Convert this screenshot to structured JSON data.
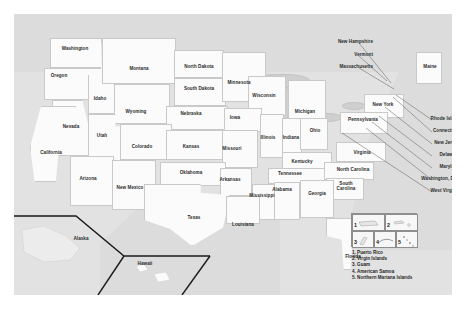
{
  "figure": {
    "kind": "united-states-map",
    "background_color": "#ffffff",
    "panel_color": "#e2e2e2",
    "state_fill": "#fbfbfb",
    "state_border": "#c9c9c9",
    "water_color": "#cfcfcf",
    "label_color": "#2b2b2b"
  },
  "states": [
    {
      "name": "Washington",
      "x": 61,
      "y": 35
    },
    {
      "name": "Oregon",
      "x": 45,
      "y": 62
    },
    {
      "name": "Idaho",
      "x": 86,
      "y": 85
    },
    {
      "name": "Montana",
      "x": 125,
      "y": 55
    },
    {
      "name": "North Dakota",
      "x": 185,
      "y": 53
    },
    {
      "name": "Minnesota",
      "x": 225,
      "y": 69
    },
    {
      "name": "Wyoming",
      "x": 122,
      "y": 98
    },
    {
      "name": "South Dakota",
      "x": 185,
      "y": 75
    },
    {
      "name": "Wisconsin",
      "x": 250,
      "y": 82
    },
    {
      "name": "Michigan",
      "x": 291,
      "y": 98
    },
    {
      "name": "Nevada",
      "x": 57,
      "y": 113
    },
    {
      "name": "Utah",
      "x": 88,
      "y": 122
    },
    {
      "name": "Nebraska",
      "x": 177,
      "y": 100
    },
    {
      "name": "Iowa",
      "x": 221,
      "y": 104
    },
    {
      "name": "Illinois",
      "x": 254,
      "y": 124
    },
    {
      "name": "Indiana",
      "x": 277,
      "y": 124
    },
    {
      "name": "Ohio",
      "x": 301,
      "y": 117
    },
    {
      "name": "New York",
      "x": 369,
      "y": 91
    },
    {
      "name": "Pennsylvania",
      "x": 349,
      "y": 106
    },
    {
      "name": "Maine",
      "x": 416,
      "y": 53
    },
    {
      "name": "California",
      "x": 37,
      "y": 139
    },
    {
      "name": "Colorado",
      "x": 128,
      "y": 133
    },
    {
      "name": "Kansas",
      "x": 177,
      "y": 133
    },
    {
      "name": "Missouri",
      "x": 218,
      "y": 135
    },
    {
      "name": "Kentucky",
      "x": 288,
      "y": 148
    },
    {
      "name": "Virginia",
      "x": 348,
      "y": 139
    },
    {
      "name": "Arizona",
      "x": 74,
      "y": 165
    },
    {
      "name": "New Mexico",
      "x": 116,
      "y": 174
    },
    {
      "name": "Oklahoma",
      "x": 177,
      "y": 159
    },
    {
      "name": "Arkansas",
      "x": 216,
      "y": 166
    },
    {
      "name": "Tennessee",
      "x": 276,
      "y": 160
    },
    {
      "name": "North Carolina",
      "x": 339,
      "y": 156
    },
    {
      "name": "South Carolina",
      "x": 332,
      "y": 172,
      "wrap": true
    },
    {
      "name": "Mississippi",
      "x": 248,
      "y": 182
    },
    {
      "name": "Alabama",
      "x": 268,
      "y": 176
    },
    {
      "name": "Georgia",
      "x": 303,
      "y": 180
    },
    {
      "name": "Texas",
      "x": 180,
      "y": 204
    },
    {
      "name": "Louisiana",
      "x": 229,
      "y": 211
    },
    {
      "name": "Florida",
      "x": 339,
      "y": 243
    },
    {
      "name": "Alaska",
      "x": 67,
      "y": 225
    },
    {
      "name": "Hawaii",
      "x": 131,
      "y": 250
    }
  ],
  "callout_labels": [
    {
      "name": "New Hampshire",
      "x": 359,
      "y": 28,
      "lx": 391,
      "ly": 68
    },
    {
      "name": "Vermont",
      "x": 359,
      "y": 41,
      "lx": 387,
      "ly": 66
    },
    {
      "name": "Massachusetts",
      "x": 359,
      "y": 53,
      "lx": 394,
      "ly": 74
    },
    {
      "name": "Rhode Island",
      "x": 446,
      "y": 105,
      "lx": 396,
      "ly": 80
    },
    {
      "name": "Connecticut",
      "x": 446,
      "y": 117,
      "lx": 393,
      "ly": 82
    },
    {
      "name": "New Jersey",
      "x": 446,
      "y": 129,
      "lx": 385,
      "ly": 92
    },
    {
      "name": "Delaware",
      "x": 446,
      "y": 141,
      "lx": 379,
      "ly": 101
    },
    {
      "name": "Maryland",
      "x": 446,
      "y": 153,
      "lx": 372,
      "ly": 107
    },
    {
      "name": "Washington, D.C.",
      "x": 446,
      "y": 165,
      "lx": 366,
      "ly": 113
    },
    {
      "name": "West Virginia",
      "x": 446,
      "y": 177,
      "lx": 342,
      "ly": 118
    }
  ],
  "territories": {
    "numbers": [
      "1",
      "2",
      "3",
      "4",
      "5"
    ],
    "items": [
      "1. Puerto Rico",
      "2. Virgin Islands",
      "3. Guam",
      "4. American Samoa",
      "5. Northern Mariana Islands"
    ]
  }
}
